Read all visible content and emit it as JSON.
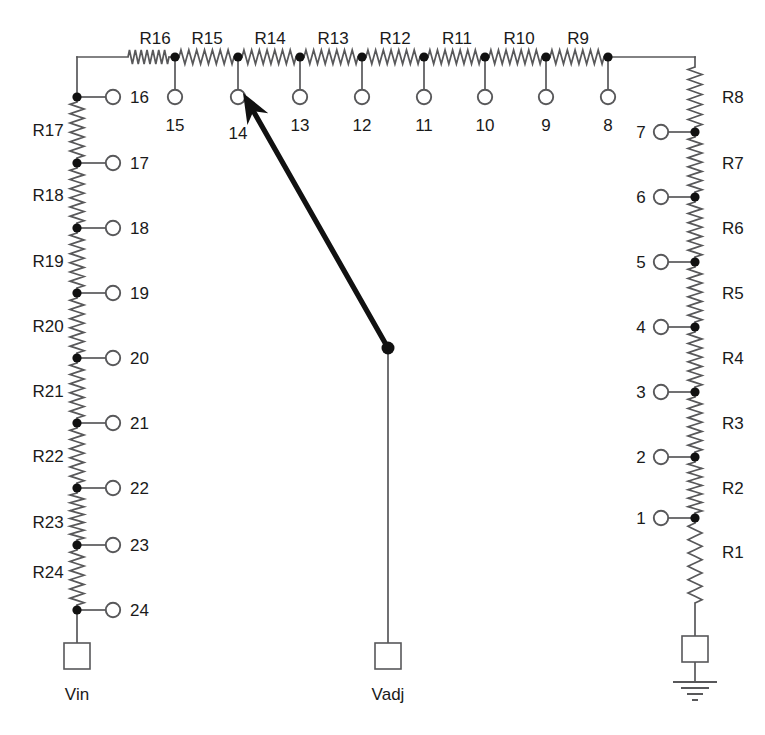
{
  "diagram": {
    "background_color": "#ffffff",
    "wire_color": "#58585a",
    "node_color": "#111111",
    "text_color": "#1a1a1a",
    "wiper_color": "#111111"
  },
  "ports": [
    {
      "name": "Vin",
      "label": "Vin",
      "x": 77,
      "y": 658,
      "label_x": 77,
      "label_y": 700
    },
    {
      "name": "Vadj",
      "label": "Vadj",
      "x": 388,
      "y": 658,
      "label_x": 388,
      "label_y": 700
    },
    {
      "name": "gnd",
      "label": "",
      "x": 695,
      "y": 655,
      "label_x": 695,
      "label_y": 700
    }
  ],
  "top_resistors": [
    {
      "label": "R16",
      "label_x": 155,
      "label_y": 44
    },
    {
      "label": "R15",
      "label_x": 207,
      "label_y": 44
    },
    {
      "label": "R14",
      "label_x": 270,
      "label_y": 44
    },
    {
      "label": "R13",
      "label_x": 333,
      "label_y": 44
    },
    {
      "label": "R12",
      "label_x": 395,
      "label_y": 44
    },
    {
      "label": "R11",
      "label_x": 457,
      "label_y": 44
    },
    {
      "label": "R10",
      "label_x": 519,
      "label_y": 44
    },
    {
      "label": "R9",
      "label_x": 578,
      "label_y": 44
    }
  ],
  "left_resistors": [
    {
      "label": "R17",
      "label_x": 48,
      "label_y": 136
    },
    {
      "label": "R18",
      "label_x": 48,
      "label_y": 201
    },
    {
      "label": "R19",
      "label_x": 48,
      "label_y": 267
    },
    {
      "label": "R20",
      "label_x": 48,
      "label_y": 332
    },
    {
      "label": "R21",
      "label_x": 48,
      "label_y": 397
    },
    {
      "label": "R22",
      "label_x": 48,
      "label_y": 462
    },
    {
      "label": "R23",
      "label_x": 48,
      "label_y": 528
    },
    {
      "label": "R24",
      "label_x": 48,
      "label_y": 578
    }
  ],
  "right_resistors": [
    {
      "label": "R8",
      "label_x": 722,
      "label_y": 103
    },
    {
      "label": "R7",
      "label_x": 722,
      "label_y": 169
    },
    {
      "label": "R6",
      "label_x": 722,
      "label_y": 234
    },
    {
      "label": "R5",
      "label_x": 722,
      "label_y": 299
    },
    {
      "label": "R4",
      "label_x": 722,
      "label_y": 364
    },
    {
      "label": "R3",
      "label_x": 722,
      "label_y": 429
    },
    {
      "label": "R2",
      "label_x": 722,
      "label_y": 494
    },
    {
      "label": "R1",
      "label_x": 722,
      "label_y": 558
    }
  ],
  "top_taps": [
    {
      "label": "15",
      "node_x": 175,
      "node_y": 57,
      "circle_y": 97,
      "label_x": 175,
      "label_y": 131
    },
    {
      "label": "14",
      "node_x": 238,
      "node_y": 57,
      "circle_y": 97,
      "label_x": 238,
      "label_y": 139
    },
    {
      "label": "13",
      "node_x": 300,
      "node_y": 57,
      "circle_y": 97,
      "label_x": 300,
      "label_y": 131
    },
    {
      "label": "12",
      "node_x": 362,
      "node_y": 57,
      "circle_y": 97,
      "label_x": 362,
      "label_y": 131
    },
    {
      "label": "11",
      "node_x": 424,
      "node_y": 57,
      "circle_y": 97,
      "label_x": 424,
      "label_y": 131
    },
    {
      "label": "10",
      "node_x": 485,
      "node_y": 57,
      "circle_y": 97,
      "label_x": 485,
      "label_y": 131
    },
    {
      "label": "9",
      "node_x": 546,
      "node_y": 57,
      "circle_y": 97,
      "label_x": 546,
      "label_y": 131
    },
    {
      "label": "8",
      "node_x": 608,
      "node_y": 57,
      "circle_y": 97,
      "label_x": 608,
      "label_y": 131
    }
  ],
  "left_taps": [
    {
      "label": "16",
      "node_x": 77,
      "node_y": 97,
      "circle_x": 113,
      "label_x": 130,
      "label_y": 103
    },
    {
      "label": "17",
      "node_x": 77,
      "node_y": 163,
      "circle_x": 113,
      "label_x": 130,
      "label_y": 169
    },
    {
      "label": "18",
      "node_x": 77,
      "node_y": 228,
      "circle_x": 113,
      "label_x": 130,
      "label_y": 234
    },
    {
      "label": "19",
      "node_x": 77,
      "node_y": 293,
      "circle_x": 113,
      "label_x": 130,
      "label_y": 299
    },
    {
      "label": "20",
      "node_x": 77,
      "node_y": 358,
      "circle_x": 113,
      "label_x": 130,
      "label_y": 364
    },
    {
      "label": "21",
      "node_x": 77,
      "node_y": 423,
      "circle_x": 113,
      "label_x": 130,
      "label_y": 429
    },
    {
      "label": "22",
      "node_x": 77,
      "node_y": 488,
      "circle_x": 113,
      "label_x": 130,
      "label_y": 494
    },
    {
      "label": "23",
      "node_x": 77,
      "node_y": 545,
      "circle_x": 113,
      "label_x": 130,
      "label_y": 551
    },
    {
      "label": "24",
      "node_x": 77,
      "node_y": 610,
      "circle_x": 113,
      "label_x": 130,
      "label_y": 616
    }
  ],
  "right_taps": [
    {
      "label": "7",
      "node_x": 695,
      "node_y": 132,
      "circle_x": 661,
      "label_x": 641,
      "label_y": 138
    },
    {
      "label": "6",
      "node_x": 695,
      "node_y": 197,
      "circle_x": 661,
      "label_x": 641,
      "label_y": 203
    },
    {
      "label": "5",
      "node_x": 695,
      "node_y": 262,
      "circle_x": 661,
      "label_x": 641,
      "label_y": 268
    },
    {
      "label": "4",
      "node_x": 695,
      "node_y": 327,
      "circle_x": 661,
      "label_x": 641,
      "label_y": 333
    },
    {
      "label": "3",
      "node_x": 695,
      "node_y": 392,
      "circle_x": 661,
      "label_x": 641,
      "label_y": 398
    },
    {
      "label": "2",
      "node_x": 695,
      "node_y": 457,
      "circle_x": 661,
      "label_x": 641,
      "label_y": 463
    },
    {
      "label": "1",
      "node_x": 695,
      "node_y": 518,
      "circle_x": 661,
      "label_x": 641,
      "label_y": 524
    }
  ],
  "wiper": {
    "from_x": 388,
    "from_y": 348,
    "to_x": 243,
    "to_y": 93,
    "selected_tap": "14"
  }
}
